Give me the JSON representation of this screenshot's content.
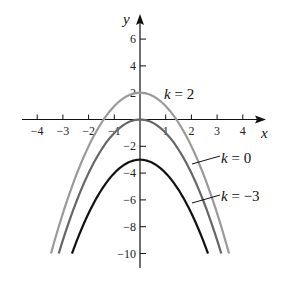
{
  "chart_data": {
    "type": "line",
    "title": "",
    "xlabel": "x",
    "ylabel": "y",
    "xlim": [
      -4.5,
      4.8
    ],
    "ylim": [
      -11,
      7.5
    ],
    "x_ticks": [
      -4,
      -3,
      -2,
      -1,
      1,
      2,
      3,
      4
    ],
    "x_tick_labels": [
      "−4",
      "−3",
      "−2",
      "−1",
      "1",
      "2",
      "3",
      "4"
    ],
    "y_ticks": [
      6,
      4,
      2,
      -2,
      -4,
      -6,
      -8,
      -10
    ],
    "y_tick_labels": [
      "6",
      "4",
      "2",
      "−2",
      "−4",
      "−6",
      "−8",
      "−10"
    ],
    "grid": false,
    "legend_position": "inline labels on right",
    "formula": "y = -x^2 + k",
    "series": [
      {
        "name": "k = 2",
        "k": 2,
        "color": "#9a9a9a",
        "label_var": "k",
        "label_rest": " = 2"
      },
      {
        "name": "k = 0",
        "k": 0,
        "color": "#666666",
        "label_var": "k",
        "label_rest": " = 0"
      },
      {
        "name": "k = −3",
        "k": -3,
        "color": "#111111",
        "label_var": "k",
        "label_rest": " = −3"
      }
    ],
    "y_min_plotted": -10
  },
  "layout": {
    "origin_px": [
      140,
      119.5
    ],
    "x_scale": 25.7,
    "y_scale": 13.4
  }
}
